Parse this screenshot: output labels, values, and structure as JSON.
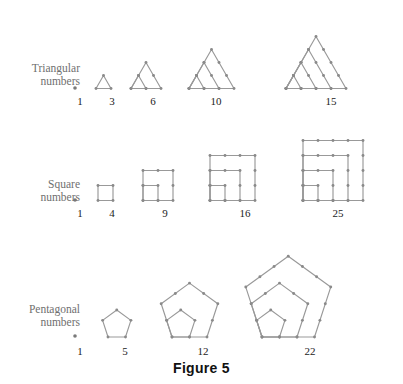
{
  "figure": {
    "caption": "Figure 5",
    "background_color": "#ffffff",
    "line_color": "#999999",
    "dot_color": "#8a8a8a",
    "label_color": "#6f6f6f",
    "number_color": "#222222"
  },
  "rows": [
    {
      "id": "triangular",
      "label_line1": "Triangular",
      "label_line2": "numbers",
      "counts": [
        "1",
        "3",
        "6",
        "10",
        "15"
      ]
    },
    {
      "id": "square",
      "label_line1": "Square",
      "label_line2": "numbers",
      "counts": [
        "1",
        "4",
        "9",
        "16",
        "25"
      ]
    },
    {
      "id": "pentagonal",
      "label_line1": "Pentagonal",
      "label_line2": "numbers",
      "counts": [
        "1",
        "5",
        "12",
        "22"
      ]
    }
  ],
  "chart_data": {
    "type": "diagram",
    "title": "Figure 5",
    "series": [
      {
        "name": "Triangular numbers",
        "formula": "n(n+1)/2",
        "terms": [
          1,
          3,
          6,
          10,
          15
        ],
        "shape": "triangle",
        "nesting": "n nested equilateral triangles sharing the bottom-left vertex"
      },
      {
        "name": "Square numbers",
        "formula": "n^2",
        "terms": [
          1,
          4,
          9,
          16,
          25
        ],
        "shape": "square",
        "nesting": "n nested squares sharing the bottom-left corner, forming gnomons"
      },
      {
        "name": "Pentagonal numbers",
        "formula": "n(3n-1)/2",
        "terms": [
          1,
          5,
          12,
          22
        ],
        "shape": "pentagon",
        "nesting": "n nested regular pentagons sharing the bottom-left vertex"
      }
    ]
  }
}
